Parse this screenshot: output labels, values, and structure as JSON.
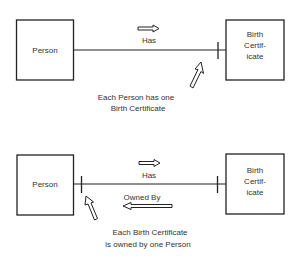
{
  "diagram": {
    "type": "entity-relationship",
    "colors": {
      "stroke": "#222222",
      "text": "#333333",
      "background": "#ffffff"
    },
    "top": {
      "left_entity": "Person",
      "right_entity_lines": [
        "Birth",
        "Certif-",
        "icate"
      ],
      "relationship_label": "Has",
      "relationship_direction": "right",
      "cardinality_marks": [
        "one-at-birth-certificate"
      ],
      "caption_lines": [
        "Each Person has one",
        "Birth Certificate"
      ]
    },
    "bottom": {
      "left_entity": "Person",
      "right_entity_lines": [
        "Birth",
        "Certif-",
        "icate"
      ],
      "forward_label": "Has",
      "forward_direction": "right",
      "reverse_label": "Owned By",
      "reverse_direction": "left",
      "cardinality_marks": [
        "one-at-person",
        "one-at-birth-certificate"
      ],
      "caption_lines": [
        "Each Birth Certificate",
        "is owned by one Person"
      ]
    }
  }
}
